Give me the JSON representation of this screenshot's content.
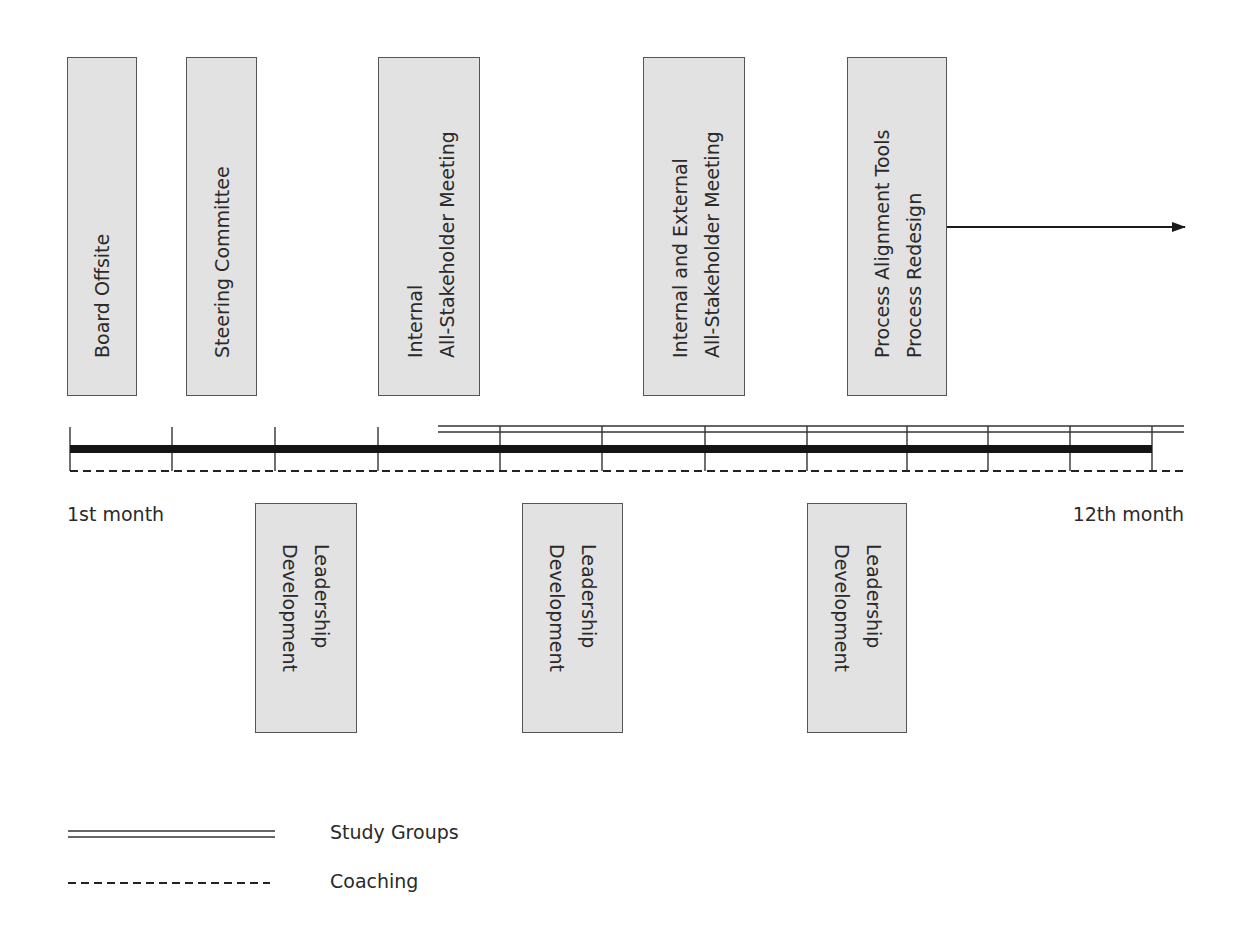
{
  "diagram": {
    "title": "",
    "top_boxes": [
      {
        "id": "board-offsite",
        "lines": [
          "Board Offsite"
        ]
      },
      {
        "id": "steering-committee",
        "lines": [
          "Steering Committee"
        ]
      },
      {
        "id": "internal-all-stakeholder",
        "lines": [
          "Internal",
          "All-Stakeholder Meeting"
        ]
      },
      {
        "id": "internal-external-all-stakeholder",
        "lines": [
          "Internal and External",
          "All-Stakeholder Meeting"
        ]
      },
      {
        "id": "process-alignment",
        "lines": [
          "Process Alignment Tools",
          "Process Redesign"
        ]
      }
    ],
    "bottom_boxes": [
      {
        "id": "leadership-development-1",
        "lines": [
          "Leadership",
          "Development"
        ]
      },
      {
        "id": "leadership-development-2",
        "lines": [
          "Leadership",
          "Development"
        ]
      },
      {
        "id": "leadership-development-3",
        "lines": [
          "Leadership",
          "Development"
        ]
      }
    ],
    "timeline": {
      "start_label": "1st month",
      "end_label": "12th month",
      "tick_count": 12
    },
    "legend": [
      {
        "style": "double-line",
        "label": "Study Groups"
      },
      {
        "style": "dashed-line",
        "label": "Coaching"
      }
    ],
    "colors": {
      "box_fill": "#e2e2e2",
      "box_border": "#555555",
      "line": "#1a1a1a",
      "text": "#2a2a2a"
    }
  }
}
